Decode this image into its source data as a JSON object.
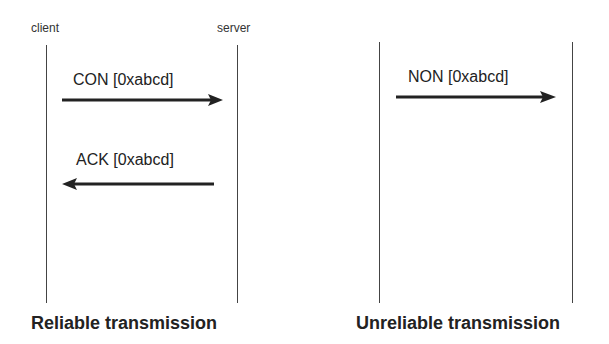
{
  "diagrams": [
    {
      "caption": "Reliable transmission",
      "actors": {
        "left": "client",
        "right": "server"
      },
      "messages": [
        {
          "label": "CON [0xabcd]",
          "direction": "left-to-right"
        },
        {
          "label": "ACK [0xabcd]",
          "direction": "right-to-left"
        }
      ]
    },
    {
      "caption": "Unreliable transmission",
      "actors": {
        "left": "",
        "right": ""
      },
      "messages": [
        {
          "label": "NON [0xabcd]",
          "direction": "left-to-right"
        }
      ]
    }
  ],
  "colors": {
    "line": "#444444",
    "arrow": "#222222",
    "text": "#222222"
  }
}
